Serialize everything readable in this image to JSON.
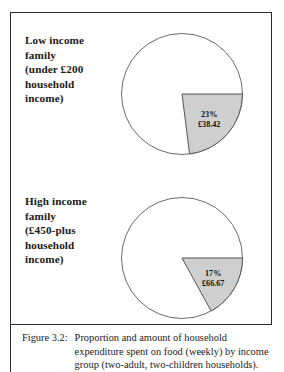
{
  "figure": {
    "caption_tag": "Figure 3.2:",
    "caption_body": "Proportion and amount of household\nexpenditure spent on food (weekly) by income\ngroup (two-adult, two-children households).",
    "frame_color": "#2b2b2b"
  },
  "colors": {
    "slice_fill": "#cfcfcf",
    "slice_stroke": "#555555",
    "circle_stroke": "#6a6a6a",
    "text": "#111111"
  },
  "panels": [
    {
      "key": "low",
      "label": "Low income\nfamily\n(under £200\nhousehold\nincome)",
      "percent_label": "23%",
      "amount_label": "£38.42"
    },
    {
      "key": "high",
      "label": "High income\nfamily\n(£450-plus\nhousehold\nincome)",
      "percent_label": "17%",
      "amount_label": "£66.67"
    }
  ],
  "chart_data": [
    {
      "type": "pie",
      "title": "Low income family (under £200 household income)",
      "categories": [
        "Food",
        "Other expenditure"
      ],
      "values": [
        23,
        77
      ],
      "value_labels": [
        "23%",
        "77%"
      ],
      "amounts": [
        "£38.42",
        ""
      ],
      "unit": "percent",
      "start_angle_deg": 90,
      "legend": "none",
      "highlight_index": 0
    },
    {
      "type": "pie",
      "title": "High income family (£450-plus household income)",
      "categories": [
        "Food",
        "Other expenditure"
      ],
      "values": [
        17,
        83
      ],
      "value_labels": [
        "17%",
        "83%"
      ],
      "amounts": [
        "£66.67",
        ""
      ],
      "unit": "percent",
      "start_angle_deg": 90,
      "legend": "none",
      "highlight_index": 0
    }
  ]
}
